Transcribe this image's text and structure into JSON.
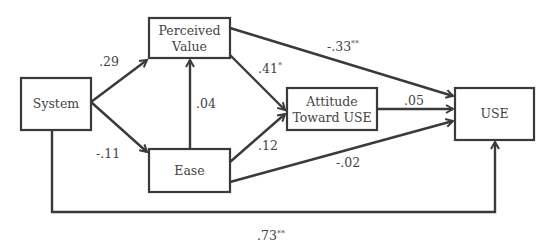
{
  "diagram": {
    "nodes": {
      "system": {
        "label": "System"
      },
      "perceived_value": {
        "line1": "Perceived",
        "line2": "Value"
      },
      "ease": {
        "label": "Ease"
      },
      "attitude": {
        "line1": "Attitude",
        "line2": "Toward USE"
      },
      "use": {
        "label": "USE"
      }
    },
    "edges": {
      "system_to_perceived_value": {
        "coef": ".29",
        "sig": ""
      },
      "system_to_ease": {
        "coef": "-.11",
        "sig": ""
      },
      "ease_to_perceived_value": {
        "coef": ".04",
        "sig": ""
      },
      "perceived_value_to_attitude": {
        "coef": ".41",
        "sig": "*"
      },
      "ease_to_attitude": {
        "coef": ".12",
        "sig": ""
      },
      "perceived_value_to_use": {
        "coef": "-.33",
        "sig": "**"
      },
      "attitude_to_use": {
        "coef": ".05",
        "sig": ""
      },
      "ease_to_use": {
        "coef": "-.02",
        "sig": ""
      },
      "system_to_use": {
        "coef": ".73",
        "sig": "**"
      }
    },
    "colors": {
      "stroke": "#3a3a3a",
      "text": "#444444",
      "background": "#ffffff"
    }
  }
}
